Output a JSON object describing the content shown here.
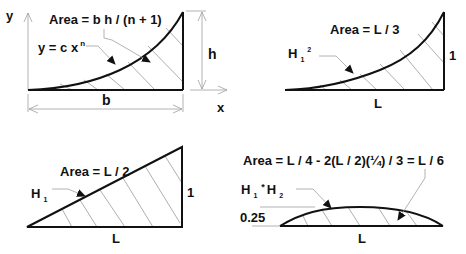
{
  "diagrams": {
    "general": {
      "area_formula": "Area = b h / (n + 1)",
      "curve_label": "y = c x",
      "curve_exponent": "n",
      "y_axis": "y",
      "x_axis": "x",
      "height_label": "h",
      "base_label": "b"
    },
    "parabolic": {
      "area_formula": "Area = L / 3",
      "shape_fn": "H",
      "shape_sub": "1",
      "shape_sup": "2",
      "height_label": "1",
      "base_label": "L"
    },
    "linear": {
      "area_formula": "Area = L / 2",
      "shape_fn": "H",
      "shape_sub": "1",
      "height_label": "1",
      "base_label": "L"
    },
    "product": {
      "area_formula": "Area = L / 4 - 2(L / 2)(¼) / 3 = L / 6",
      "shape_fn1": "H",
      "shape_sub1": "1",
      "operator": "*",
      "shape_fn2": "H",
      "shape_sub2": "2",
      "height_label": "0.25",
      "base_label": "L"
    }
  }
}
